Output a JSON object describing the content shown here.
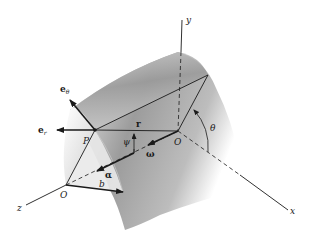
{
  "figure": {
    "type": "3D kinematics diagram",
    "colors": {
      "ink": "#1a1a1a",
      "surface_light": "#f2f2f2",
      "surface_dark": "#8a8a8a",
      "background": "#ffffff"
    },
    "axes": {
      "x": "x",
      "y": "y",
      "z": "z"
    },
    "points": {
      "origin_back": "O",
      "origin_front": "O",
      "P": "P"
    },
    "vectors": {
      "e_theta": {
        "base": "e",
        "sub": "θ"
      },
      "e_r": {
        "base": "e",
        "sub": "r"
      },
      "r": "r",
      "omega": "ω",
      "alpha": "α",
      "b": "b"
    },
    "angles": {
      "theta": "θ",
      "psi": "ψ"
    }
  }
}
